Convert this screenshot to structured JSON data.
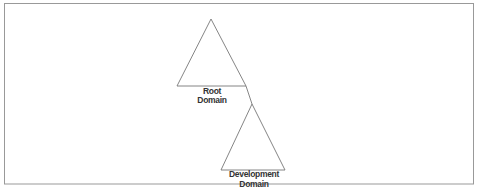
{
  "diagram": {
    "type": "domain-tree",
    "frame_color": "#999999",
    "line_color": "#666666",
    "nodes": [
      {
        "id": "root",
        "label_line1": "Root",
        "label_line2": "Domain"
      },
      {
        "id": "dev",
        "label_line1": "Development",
        "label_line2": "Domain"
      }
    ],
    "edges": [
      {
        "from": "root",
        "to": "dev"
      }
    ]
  }
}
